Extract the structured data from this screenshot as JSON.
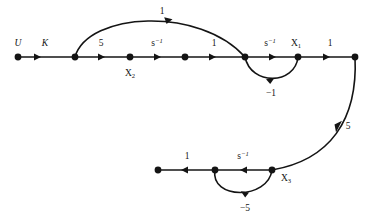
{
  "diagram": {
    "type": "signal-flow-graph",
    "stroke_color": "#141414",
    "background_color": "#ffffff",
    "node_labels": {
      "input": "U",
      "x1": "X",
      "x1_sub": "1",
      "x2": "X",
      "x2_sub": "2",
      "x3": "X",
      "x3_sub": "3"
    },
    "edge_labels": {
      "gain_k": "K",
      "gain_5_forward": "5",
      "gain_s_inv_1": "s",
      "gain_s_inv_1_sup": "−1",
      "gain_1_mid": "1",
      "gain_s_inv_2": "s",
      "gain_s_inv_2_sup": "−1",
      "gain_1_out": "1",
      "gain_1_top_arc": "1",
      "gain_neg1_loop": "−1",
      "gain_5_down": "5",
      "gain_s_inv_3": "s",
      "gain_s_inv_3_sup": "−1",
      "gain_1_bottom": "1",
      "gain_neg5_loop": "−5"
    },
    "nodes": [
      {
        "name": "node-u",
        "x": 18,
        "y": 57,
        "label": "U"
      },
      {
        "name": "node-summing-1",
        "x": 75,
        "y": 57,
        "label": ""
      },
      {
        "name": "node-x2",
        "x": 130,
        "y": 57,
        "label": "X2"
      },
      {
        "name": "node-mid",
        "x": 185,
        "y": 57,
        "label": ""
      },
      {
        "name": "node-summing-2",
        "x": 245,
        "y": 57,
        "label": ""
      },
      {
        "name": "node-x1",
        "x": 298,
        "y": 57,
        "label": "X1"
      },
      {
        "name": "node-output",
        "x": 355,
        "y": 57,
        "label": ""
      },
      {
        "name": "node-bottom-left",
        "x": 158,
        "y": 170,
        "label": ""
      },
      {
        "name": "node-bottom-mid",
        "x": 215,
        "y": 170,
        "label": ""
      },
      {
        "name": "node-x3",
        "x": 272,
        "y": 170,
        "label": "X3"
      }
    ],
    "edges": [
      {
        "name": "edge-u-to-sum1",
        "gain": "K",
        "from": "node-u",
        "to": "node-summing-1"
      },
      {
        "name": "edge-sum1-to-x2",
        "gain": "5",
        "from": "node-summing-1",
        "to": "node-x2"
      },
      {
        "name": "edge-x2-to-mid",
        "gain": "s^-1",
        "from": "node-x2",
        "to": "node-mid"
      },
      {
        "name": "edge-mid-to-sum2",
        "gain": "1",
        "from": "node-mid",
        "to": "node-summing-2"
      },
      {
        "name": "edge-sum2-to-x1",
        "gain": "s^-1",
        "from": "node-summing-2",
        "to": "node-x1"
      },
      {
        "name": "edge-x1-to-output",
        "gain": "1",
        "from": "node-x1",
        "to": "node-output"
      },
      {
        "name": "edge-top-arc",
        "gain": "1",
        "from": "node-summing-1",
        "to": "node-summing-2"
      },
      {
        "name": "edge-feedback-neg1",
        "gain": "-1",
        "from": "node-x1",
        "to": "node-summing-2"
      },
      {
        "name": "edge-output-to-x3",
        "gain": "5",
        "from": "node-output",
        "to": "node-x3"
      },
      {
        "name": "edge-x3-to-bottom-mid",
        "gain": "s^-1",
        "from": "node-x3",
        "to": "node-bottom-mid"
      },
      {
        "name": "edge-bottom-mid-left",
        "gain": "1",
        "from": "node-bottom-mid",
        "to": "node-bottom-left"
      },
      {
        "name": "edge-feedback-neg5",
        "gain": "-5",
        "from": "node-bottom-mid",
        "to": "node-x3"
      }
    ]
  }
}
